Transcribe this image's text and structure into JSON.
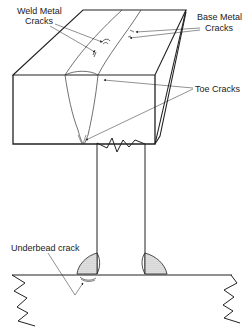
{
  "figure": {
    "top_diagram": {
      "labels": {
        "weld_metal_line1": "Weld Metal",
        "weld_metal_line2": "Cracks",
        "base_metal_line1": "Base Metal",
        "base_metal_line2": "Cracks",
        "toe_cracks": "Toe Cracks"
      }
    },
    "bottom_diagram": {
      "labels": {
        "underbead": "Underbead crack"
      }
    },
    "colors": {
      "line": "#222222",
      "fill_weld": "#d8d8d8",
      "background": "#ffffff"
    }
  }
}
